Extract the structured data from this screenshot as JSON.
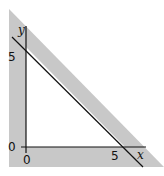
{
  "diagram": {
    "axes": {
      "x_label": "x",
      "y_label": "y",
      "origin_x_label": "0",
      "origin_y_label": "0",
      "x_tick_label": "5",
      "y_tick_label": "5"
    },
    "line": {
      "equation_hint": "x + y = 5",
      "color": "#111111"
    },
    "shaded_region": {
      "color": "#c8c8c8",
      "description": "region outside the triangle bounded by the axes and the line"
    },
    "background": "#ffffff"
  }
}
